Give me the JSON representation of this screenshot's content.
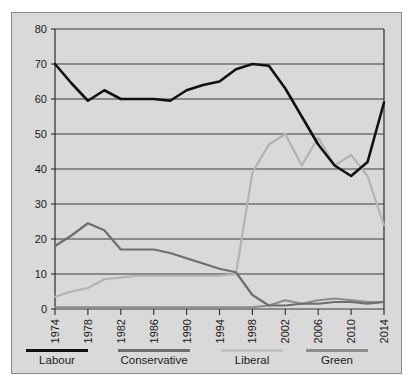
{
  "figure": {
    "cropped_caption_above": "",
    "panel_background": "#d9d9d9",
    "panel_border": "#8a8a8a",
    "gridline_color": "#3c3c3c",
    "axis_color": "#2b2b2b"
  },
  "chart_data": {
    "type": "line",
    "title": "",
    "subtitle": "",
    "xlabel": "",
    "ylabel": "",
    "xlim": [
      1974,
      2014
    ],
    "ylim": [
      0,
      80
    ],
    "yticks": [
      0,
      10,
      20,
      30,
      40,
      50,
      60,
      70,
      80
    ],
    "xticks": [
      1974,
      1978,
      1982,
      1986,
      1990,
      1994,
      1998,
      2002,
      2006,
      2010,
      2014
    ],
    "xtick_labels": [
      "1974",
      "1978",
      "1982",
      "1986",
      "1990",
      "1994",
      "1998",
      "2002",
      "2006",
      "2010",
      "2014"
    ],
    "ytick_labels": [
      "0",
      "10",
      "20",
      "30",
      "40",
      "50",
      "60",
      "70",
      "80"
    ],
    "grid": true,
    "grid_axis": "y",
    "legend_position": "below-axis",
    "x": [
      1974,
      1976,
      1978,
      1980,
      1982,
      1984,
      1986,
      1988,
      1990,
      1992,
      1994,
      1996,
      1998,
      2000,
      2002,
      2004,
      2006,
      2008,
      2010,
      2012,
      2014
    ],
    "series": [
      {
        "name": "Labour",
        "color": "#111111",
        "width": 2.6,
        "values": [
          70,
          64.5,
          59.5,
          62.5,
          60,
          60,
          60,
          59.5,
          62.5,
          64,
          65,
          68.5,
          70,
          69.5,
          63,
          55,
          47,
          41,
          38,
          42,
          59
        ]
      },
      {
        "name": "Conservative",
        "color": "#6e6e6e",
        "width": 2.2,
        "values": [
          18,
          21,
          24.5,
          22.5,
          17,
          17,
          17,
          16,
          14.5,
          13,
          11.5,
          10.5,
          4,
          1,
          1,
          1.5,
          1.5,
          2,
          2,
          1.5,
          2
        ]
      },
      {
        "name": "Liberal",
        "color": "#b3b3b3",
        "width": 2.2,
        "values": [
          3.5,
          5,
          6,
          8.5,
          9,
          9.5,
          9.5,
          9.5,
          9.5,
          9.5,
          9.5,
          10,
          39,
          47,
          50,
          41,
          49,
          41,
          44,
          38,
          24
        ]
      },
      {
        "name": "Green",
        "color": "#8c8c8c",
        "width": 2.2,
        "values": [
          0.5,
          0.5,
          0.5,
          0.5,
          0.5,
          0.5,
          0.5,
          0.5,
          0.5,
          0.5,
          0.5,
          0.5,
          0.5,
          1,
          2.5,
          1.5,
          2.5,
          3,
          2.5,
          2,
          2
        ]
      }
    ],
    "legend": [
      {
        "label": "Labour",
        "color": "#111111",
        "swatch_width": 70
      },
      {
        "label": "Conservative",
        "color": "#6e6e6e",
        "swatch_width": 80
      },
      {
        "label": "Liberal",
        "color": "#c4c4c4",
        "swatch_width": 70
      },
      {
        "label": "Green",
        "color": "#8c8c8c",
        "swatch_width": 70
      }
    ]
  }
}
